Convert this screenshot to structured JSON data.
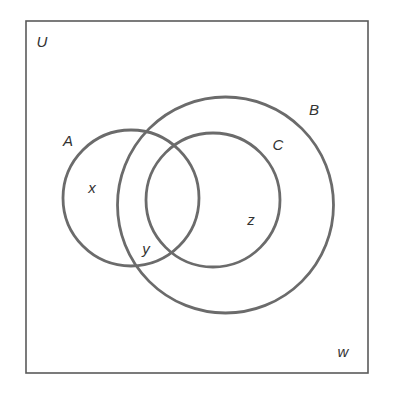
{
  "diagram": {
    "type": "venn",
    "universe": {
      "label": "U",
      "rect": {
        "x": 26,
        "y": 21,
        "width": 342,
        "height": 352
      },
      "label_pos": {
        "x": 42,
        "y": 41
      }
    },
    "sets": [
      {
        "id": "A",
        "label": "A",
        "cx": 131,
        "cy": 198,
        "r": 68,
        "label_pos": {
          "x": 68,
          "y": 140
        }
      },
      {
        "id": "B",
        "label": "B",
        "cx": 225.5,
        "cy": 205,
        "r": 108,
        "label_pos": {
          "x": 314,
          "y": 109
        }
      },
      {
        "id": "C",
        "label": "C",
        "cx": 213,
        "cy": 200,
        "r": 67,
        "label_pos": {
          "x": 278,
          "y": 144
        }
      }
    ],
    "region_labels": [
      {
        "label": "x",
        "region": "A only",
        "x": 92,
        "y": 187
      },
      {
        "label": "y",
        "region": "A ∩ B, outside C",
        "x": 146,
        "y": 248
      },
      {
        "label": "z",
        "region": "C (inside B), outside A",
        "x": 251,
        "y": 219
      },
      {
        "label": "w",
        "region": "outside A and B",
        "x": 343,
        "y": 351
      }
    ],
    "colors": {
      "circle_stroke": "#6b6b6b",
      "rect_stroke": "#5a5a5a",
      "text": "#333333",
      "background": "#ffffff"
    }
  }
}
